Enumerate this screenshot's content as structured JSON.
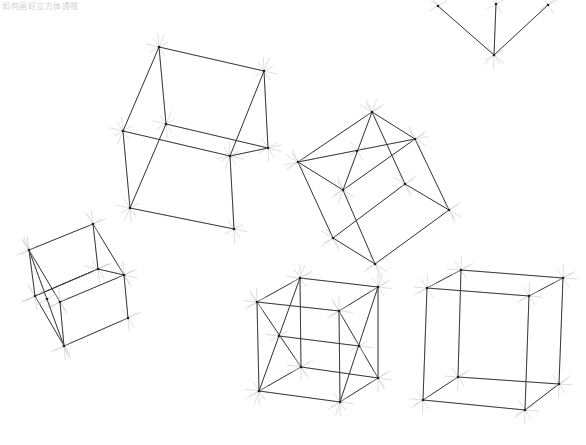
{
  "caption": "如何画好立方体透视",
  "colors": {
    "background": "#ffffff",
    "edge": "#3a3a3a",
    "guide": "#c8c8c8",
    "vertex": "#1f1f1f"
  },
  "cubes": [
    {
      "name": "cube-top-right-partial",
      "vertices": [
        [
          438,
          6
        ],
        [
          496,
          4
        ],
        [
          548,
          5
        ],
        [
          494,
          55
        ]
      ],
      "edges": [
        [
          0,
          3
        ],
        [
          1,
          3
        ],
        [
          2,
          3
        ]
      ]
    },
    {
      "name": "cube-large-upper",
      "vertices": [
        [
          159,
          47
        ],
        [
          264,
          71
        ],
        [
          123,
          131
        ],
        [
          166,
          124
        ],
        [
          268,
          148
        ],
        [
          230,
          156
        ],
        [
          130,
          208
        ],
        [
          234,
          229
        ]
      ],
      "edges": [
        [
          0,
          1
        ],
        [
          0,
          2
        ],
        [
          0,
          3
        ],
        [
          1,
          4
        ],
        [
          2,
          5
        ],
        [
          3,
          4
        ],
        [
          5,
          4
        ],
        [
          2,
          6
        ],
        [
          5,
          7
        ],
        [
          6,
          7
        ],
        [
          3,
          6
        ],
        [
          1,
          5
        ]
      ]
    },
    {
      "name": "cube-rotated-center",
      "vertices": [
        [
          372,
          112
        ],
        [
          415,
          139
        ],
        [
          298,
          162
        ],
        [
          343,
          190
        ],
        [
          405,
          184
        ],
        [
          449,
          210
        ],
        [
          333,
          238
        ],
        [
          375,
          264
        ],
        [
          357,
          151
        ]
      ],
      "edges": [
        [
          0,
          1
        ],
        [
          0,
          2
        ],
        [
          2,
          3
        ],
        [
          0,
          3
        ],
        [
          1,
          3
        ],
        [
          2,
          1
        ],
        [
          0,
          4
        ],
        [
          1,
          5
        ],
        [
          4,
          5
        ],
        [
          2,
          6
        ],
        [
          3,
          7
        ],
        [
          6,
          7
        ],
        [
          5,
          7
        ],
        [
          4,
          6
        ]
      ]
    },
    {
      "name": "cube-small-left",
      "vertices": [
        [
          29,
          250
        ],
        [
          93,
          224
        ],
        [
          98,
          269
        ],
        [
          124,
          275
        ],
        [
          35,
          296
        ],
        [
          60,
          302
        ],
        [
          128,
          318
        ],
        [
          64,
          346
        ],
        [
          47,
          299
        ]
      ],
      "edges": [
        [
          0,
          1
        ],
        [
          1,
          2
        ],
        [
          1,
          3
        ],
        [
          0,
          4
        ],
        [
          0,
          5
        ],
        [
          4,
          2
        ],
        [
          5,
          3
        ],
        [
          2,
          3
        ],
        [
          3,
          6
        ],
        [
          5,
          7
        ],
        [
          6,
          7
        ],
        [
          4,
          7
        ],
        [
          0,
          7
        ],
        [
          2,
          4
        ]
      ]
    },
    {
      "name": "cube-bottom-middle-x",
      "vertices": [
        [
          300,
          278
        ],
        [
          378,
          287
        ],
        [
          257,
          302
        ],
        [
          339,
          311
        ],
        [
          279,
          336
        ],
        [
          359,
          346
        ],
        [
          301,
          367
        ],
        [
          378,
          378
        ],
        [
          259,
          391
        ],
        [
          340,
          402
        ]
      ],
      "edges": [
        [
          0,
          1
        ],
        [
          0,
          2
        ],
        [
          1,
          3
        ],
        [
          2,
          3
        ],
        [
          0,
          6
        ],
        [
          1,
          7
        ],
        [
          2,
          8
        ],
        [
          3,
          9
        ],
        [
          6,
          7
        ],
        [
          6,
          8
        ],
        [
          7,
          9
        ],
        [
          8,
          9
        ],
        [
          4,
          5
        ],
        [
          2,
          6
        ],
        [
          0,
          8
        ],
        [
          3,
          7
        ],
        [
          1,
          9
        ]
      ]
    },
    {
      "name": "cube-bottom-right",
      "vertices": [
        [
          461,
          270
        ],
        [
          563,
          278
        ],
        [
          427,
          288
        ],
        [
          529,
          296
        ],
        [
          458,
          377
        ],
        [
          559,
          384
        ],
        [
          423,
          400
        ],
        [
          525,
          410
        ]
      ],
      "edges": [
        [
          0,
          1
        ],
        [
          0,
          2
        ],
        [
          1,
          3
        ],
        [
          2,
          3
        ],
        [
          0,
          4
        ],
        [
          1,
          5
        ],
        [
          2,
          6
        ],
        [
          3,
          7
        ],
        [
          4,
          5
        ],
        [
          4,
          6
        ],
        [
          5,
          7
        ],
        [
          6,
          7
        ]
      ]
    }
  ]
}
